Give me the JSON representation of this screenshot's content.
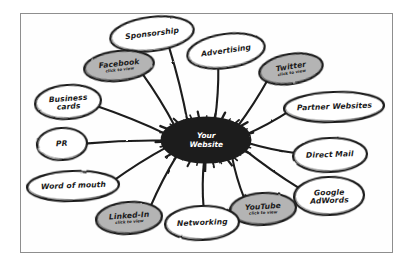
{
  "diagram": {
    "style": "hand-drawn whiteboard sketch",
    "center": {
      "name": "center-node",
      "line1": "Your",
      "line2": "Website",
      "fill": "#1c1c1c",
      "text_color": "#ffffff",
      "cx": 206,
      "cy": 140,
      "rx": 44,
      "ry": 22
    },
    "sub_label": "click to view",
    "colors": {
      "highlight_fill": "#b4b4b4",
      "plain_fill": "#ffffff",
      "ink": "#1c1c1c",
      "frame": "#8e8e8e",
      "page": "#ffffff"
    },
    "nodes": [
      {
        "id": "sponsorship",
        "label": "Sponsorship",
        "highlighted": false,
        "cx": 152,
        "cy": 34,
        "rx": 42,
        "ry": 17,
        "rot": -7,
        "lines": [
          "Sponsorship"
        ]
      },
      {
        "id": "advertising",
        "label": "Advertising",
        "highlighted": false,
        "cx": 226,
        "cy": 51,
        "rx": 39,
        "ry": 17,
        "rot": -8,
        "lines": [
          "Advertising"
        ]
      },
      {
        "id": "facebook",
        "label": "Facebook",
        "highlighted": true,
        "cx": 119,
        "cy": 66,
        "rx": 35,
        "ry": 15,
        "rot": -6,
        "lines": [
          "Facebook"
        ]
      },
      {
        "id": "twitter",
        "label": "Twitter",
        "highlighted": true,
        "cx": 291,
        "cy": 69,
        "rx": 32,
        "ry": 15,
        "rot": -9,
        "lines": [
          "Twitter"
        ]
      },
      {
        "id": "business-cards",
        "label": "Business cards",
        "highlighted": false,
        "cx": 68,
        "cy": 102,
        "rx": 33,
        "ry": 17,
        "rot": -4,
        "lines": [
          "Business",
          "cards"
        ]
      },
      {
        "id": "partner-websites",
        "label": "Partner Websites",
        "highlighted": false,
        "cx": 334,
        "cy": 107,
        "rx": 50,
        "ry": 15,
        "rot": -2,
        "lines": [
          "Partner Websites"
        ]
      },
      {
        "id": "pr",
        "label": "PR",
        "highlighted": false,
        "cx": 62,
        "cy": 144,
        "rx": 25,
        "ry": 16,
        "rot": -3,
        "lines": [
          "PR"
        ]
      },
      {
        "id": "direct-mail",
        "label": "Direct Mail",
        "highlighted": false,
        "cx": 330,
        "cy": 155,
        "rx": 37,
        "ry": 17,
        "rot": -2,
        "lines": [
          "Direct Mail"
        ]
      },
      {
        "id": "word-of-mouth",
        "label": "Word of mouth",
        "highlighted": false,
        "cx": 73,
        "cy": 186,
        "rx": 46,
        "ry": 15,
        "rot": -2,
        "lines": [
          "Word of mouth"
        ]
      },
      {
        "id": "google-adwords",
        "label": "Google AdWords",
        "highlighted": false,
        "cx": 329,
        "cy": 196,
        "rx": 35,
        "ry": 19,
        "rot": -2,
        "lines": [
          "Google",
          "AdWords"
        ]
      },
      {
        "id": "linked-in",
        "label": "Linked-In",
        "highlighted": true,
        "cx": 129,
        "cy": 218,
        "rx": 33,
        "ry": 16,
        "rot": -4,
        "lines": [
          "Linked-In"
        ]
      },
      {
        "id": "youtube",
        "label": "YouTube",
        "highlighted": true,
        "cx": 263,
        "cy": 209,
        "rx": 33,
        "ry": 16,
        "rot": -3,
        "lines": [
          "YouTube"
        ]
      },
      {
        "id": "networking",
        "label": "Networking",
        "highlighted": false,
        "cx": 202,
        "cy": 223,
        "rx": 37,
        "ry": 17,
        "rot": -2,
        "lines": [
          "Networking"
        ]
      }
    ],
    "connections": [
      {
        "from": "center",
        "to": "sponsorship"
      },
      {
        "from": "center",
        "to": "advertising"
      },
      {
        "from": "center",
        "to": "facebook"
      },
      {
        "from": "center",
        "to": "twitter"
      },
      {
        "from": "center",
        "to": "business-cards"
      },
      {
        "from": "center",
        "to": "partner-websites"
      },
      {
        "from": "center",
        "to": "pr"
      },
      {
        "from": "center",
        "to": "direct-mail"
      },
      {
        "from": "center",
        "to": "word-of-mouth"
      },
      {
        "from": "center",
        "to": "google-adwords"
      },
      {
        "from": "center",
        "to": "linked-in"
      },
      {
        "from": "center",
        "to": "youtube"
      },
      {
        "from": "center",
        "to": "networking"
      }
    ]
  }
}
